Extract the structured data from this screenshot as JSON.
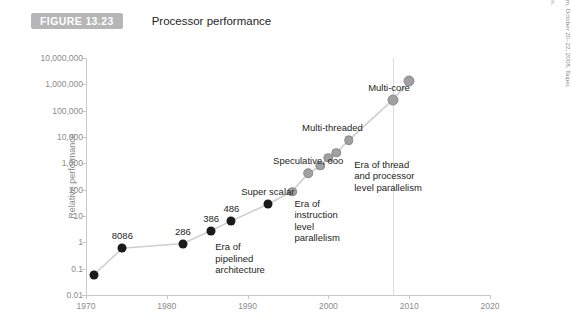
{
  "caption": {
    "badge": "FIGURE 13.23",
    "title": "Processor performance",
    "badge_color": "#b6b6b6"
  },
  "credit": {
    "line1": "Intel education, 2008 Asia Academic Forum, October 20–22, 2008, Taipei, Taiwan. Re-",
    "line2": "printed with permission of Intel Corporation."
  },
  "chart_data": {
    "type": "scatter",
    "title": "Processor performance",
    "xlabel": "",
    "ylabel": "Relative performance",
    "yscale": "log",
    "ylim": [
      0.01,
      10000000
    ],
    "xlim": [
      1970,
      2020
    ],
    "grid": false,
    "legend": "none",
    "y_ticks": [
      "10,000,000",
      "1,000,000",
      "100,000",
      "10,000",
      "1,000",
      "100",
      "10",
      "1",
      "0.1",
      "0.01"
    ],
    "y_tick_values": [
      10000000,
      1000000,
      100000,
      10000,
      1000,
      100,
      10,
      1,
      0.1,
      0.01
    ],
    "x_ticks": [
      "1970",
      "1980",
      "1990",
      "2000",
      "2010",
      "2020"
    ],
    "x_tick_values": [
      1970,
      1980,
      1990,
      2000,
      2010,
      2020
    ],
    "series": [
      {
        "name": "Single-core era",
        "color": "#1a1a1a",
        "points": [
          {
            "x": 1971,
            "y": 0.06,
            "label": ""
          },
          {
            "x": 1974.5,
            "y": 0.6,
            "label": "8086"
          },
          {
            "x": 1982,
            "y": 0.9,
            "label": "286"
          },
          {
            "x": 1985.5,
            "y": 2.8,
            "label": "386"
          },
          {
            "x": 1988,
            "y": 6.5,
            "label": "486"
          },
          {
            "x": 1992.5,
            "y": 28,
            "label": ""
          }
        ]
      },
      {
        "name": "Parallelism era",
        "color": "#a0a0a0",
        "points": [
          {
            "x": 1995.5,
            "y": 85,
            "label": ""
          },
          {
            "x": 1997.5,
            "y": 420,
            "label": ""
          },
          {
            "x": 1999,
            "y": 800,
            "label": ""
          },
          {
            "x": 2000,
            "y": 1600,
            "label": ""
          },
          {
            "x": 2001,
            "y": 2500,
            "label": ""
          },
          {
            "x": 2002.5,
            "y": 7500,
            "label": ""
          },
          {
            "x": 2008,
            "y": 260000,
            "label": ""
          },
          {
            "x": 2010,
            "y": 1300000,
            "label": ""
          }
        ]
      }
    ],
    "point_labels": [
      {
        "text": "8086",
        "x": 1974.5,
        "y": 0.6
      },
      {
        "text": "286",
        "x": 1982,
        "y": 0.9
      },
      {
        "text": "386",
        "x": 1985.5,
        "y": 2.8
      },
      {
        "text": "486",
        "x": 1988,
        "y": 6.5
      },
      {
        "text": "Super scalar",
        "x": 1992.5,
        "y": 28
      },
      {
        "text": "Speculative, ooo",
        "x": 1997.5,
        "y": 420
      },
      {
        "text": "Multi-threaded",
        "x": 2000.5,
        "y": 7500
      },
      {
        "text": "Multi-core",
        "x": 2007.5,
        "y": 260000
      }
    ],
    "annotations": [
      {
        "text": "Era of\npipelined\narchitecture",
        "x": 1986,
        "y": 1.1
      },
      {
        "text": "Era of\ninstruction\nlevel\nparallelism",
        "x": 1995.8,
        "y": 50
      },
      {
        "text": "Era of thread\nand processor\nlevel parallelism",
        "x": 2003.2,
        "y": 1500
      }
    ],
    "divider_x": 2008
  }
}
